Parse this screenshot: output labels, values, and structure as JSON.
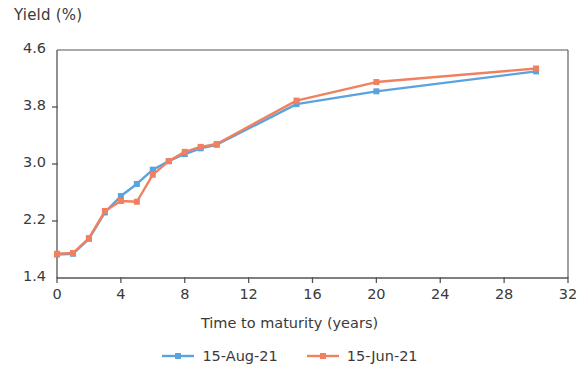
{
  "chart_data": {
    "type": "line",
    "title": "",
    "xlabel": "Time to maturity (years)",
    "ylabel": "Yield (%)",
    "xlim": [
      0,
      32
    ],
    "ylim": [
      1.4,
      4.6
    ],
    "xticks": [
      0,
      4,
      8,
      12,
      16,
      20,
      24,
      28,
      32
    ],
    "yticks": [
      1.4,
      2.2,
      3.0,
      3.8,
      4.6
    ],
    "xtick_labels": [
      "0",
      "4",
      "8",
      "12",
      "16",
      "20",
      "24",
      "28",
      "32"
    ],
    "ytick_labels": [
      "1.4",
      "2.2",
      "3.0",
      "3.8",
      "4.6"
    ],
    "grid": false,
    "legend_position": "bottom",
    "x": [
      0,
      1,
      2,
      3,
      4,
      5,
      6,
      7,
      8,
      9,
      10,
      15,
      20,
      30
    ],
    "series": [
      {
        "name": "15-Aug-21",
        "color": "#5BA3DC",
        "marker": "square",
        "values": [
          1.73,
          1.74,
          1.95,
          2.32,
          2.55,
          2.72,
          2.92,
          3.04,
          3.14,
          3.22,
          3.27,
          3.84,
          4.02,
          4.3
        ]
      },
      {
        "name": "15-Jun-21",
        "color": "#F0805F",
        "marker": "square",
        "values": [
          1.74,
          1.75,
          1.96,
          2.34,
          2.48,
          2.47,
          2.85,
          3.04,
          3.17,
          3.24,
          3.28,
          3.89,
          4.15,
          4.34
        ]
      }
    ]
  },
  "axes": {
    "y_title": "Yield (%)",
    "x_title": "Time to maturity (years)"
  },
  "legend": {
    "items": [
      {
        "label": "15-Aug-21",
        "color": "#5BA3DC"
      },
      {
        "label": "15-Jun-21",
        "color": "#F0805F"
      }
    ]
  },
  "colors": {
    "series_blue": "#5BA3DC",
    "series_orange": "#F0805F",
    "axis": "#555555",
    "text": "#3a3a3a"
  }
}
